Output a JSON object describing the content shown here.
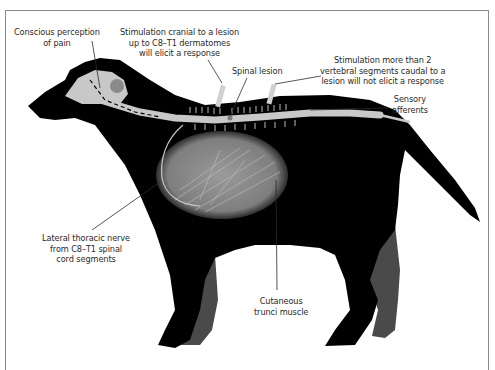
{
  "figure": {
    "colors": {
      "silhouette": "#000000",
      "far_limbs": "#4a4a4a",
      "spinal_cord": "#c8c8c8",
      "brain": "#c8c8c8",
      "muscle": "#8f8f8f",
      "frame": "#8a8a8a",
      "label_text": "#2b2b2b"
    }
  },
  "labels": {
    "conscious_perception": "Conscious perception\nof pain",
    "stimulation_cranial": "Stimulation cranial to a lesion\nup to C8–T1 dermatomes\nwill elicit a response",
    "spinal_lesion": "Spinal lesion",
    "stimulation_caudal": "Stimulation more than 2\nvertebral segments caudal to a\nlesion will not elicit a response",
    "sensory_afferents": "Sensory\nafferents",
    "lateral_thoracic_nerve": "Lateral thoracic nerve\nfrom C8–T1 spinal\ncord segments",
    "cutaneous_trunci": "Cutaneous\ntrunci muscle"
  }
}
